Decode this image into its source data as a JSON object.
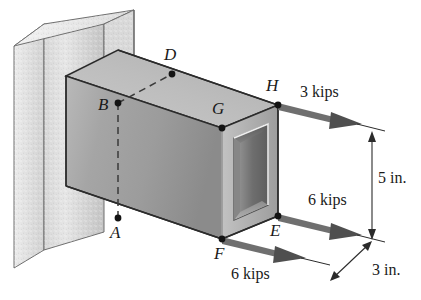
{
  "figure": {
    "background_color": "#ffffff",
    "line_color": "#1a1a1a",
    "arrow_color": "#6b6b6b",
    "wall_color_light": "#e2e2e2",
    "wall_color_mid": "#cfcfcf",
    "wall_color_dark": "#b5b5b5",
    "beam_top_color": "#bdbdbd",
    "beam_front_color": "#a8a8a8",
    "beam_side_color": "#8e8e8e",
    "cavity_color": "#7a7a7a"
  },
  "points": [
    {
      "id": "A",
      "label": "A",
      "x": 118,
      "y": 218,
      "label_x": 110,
      "label_y": 224
    },
    {
      "id": "B",
      "label": "B",
      "x": 118,
      "y": 103,
      "label_x": 100,
      "label_y": 103
    },
    {
      "id": "D",
      "label": "D",
      "x": 172,
      "y": 74,
      "label_x": 165,
      "label_y": 48
    },
    {
      "id": "E",
      "label": "E",
      "x": 278,
      "y": 216,
      "label_x": 270,
      "label_y": 222
    },
    {
      "id": "F",
      "label": "F",
      "x": 222,
      "y": 239,
      "label_x": 214,
      "label_y": 245
    },
    {
      "id": "G",
      "label": "G",
      "x": 222,
      "y": 128,
      "label_x": 213,
      "label_y": 103
    },
    {
      "id": "H",
      "label": "H",
      "x": 278,
      "y": 105,
      "label_x": 268,
      "label_y": 80
    }
  ],
  "forces": [
    {
      "id": "force-H",
      "label": "3 kips",
      "magnitude": 3,
      "unit": "kips",
      "applied_at": "H",
      "label_x": 300,
      "label_y": 90,
      "tail_x": 278,
      "tail_y": 105,
      "tip_x": 372,
      "tip_y": 128
    },
    {
      "id": "force-E",
      "label": "6 kips",
      "magnitude": 6,
      "unit": "kips",
      "applied_at": "E",
      "label_x": 308,
      "label_y": 198,
      "tail_x": 278,
      "tail_y": 216,
      "tip_x": 372,
      "tip_y": 239
    },
    {
      "id": "force-F",
      "label": "6 kips",
      "magnitude": 6,
      "unit": "kips",
      "applied_at": "F",
      "label_x": 232,
      "label_y": 272,
      "tail_x": 222,
      "tail_y": 239,
      "tip_x": 316,
      "tip_y": 262
    }
  ],
  "dimensions": [
    {
      "id": "dim-height",
      "label": "5 in.",
      "value": 5,
      "unit": "in.",
      "orientation": "vertical",
      "label_x": 379,
      "label_y": 178,
      "from_x": 372,
      "from_y": 133,
      "to_x": 372,
      "to_y": 238
    },
    {
      "id": "dim-depth",
      "label": "3 in.",
      "value": 3,
      "unit": "in.",
      "orientation": "diagonal",
      "label_x": 376,
      "label_y": 268,
      "from_x": 372,
      "from_y": 241,
      "to_x": 330,
      "to_y": 281
    }
  ]
}
